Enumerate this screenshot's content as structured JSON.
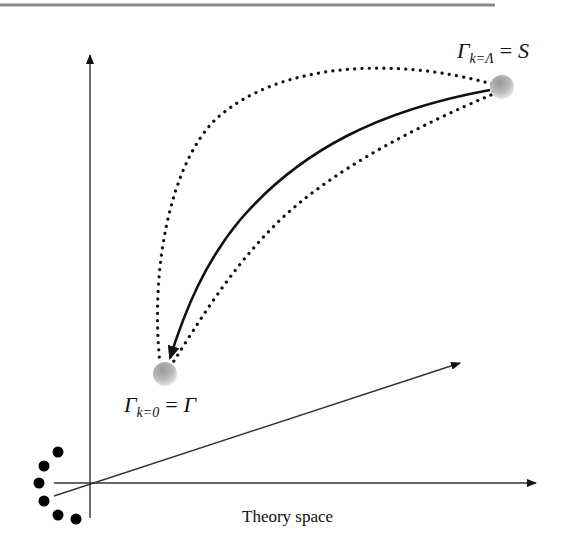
{
  "figure": {
    "type": "rg-flow-theory-space",
    "top_rule_color": "#8a8a8a",
    "line_color": "#111111"
  },
  "axes": {
    "horizontal_label": "Theory space",
    "count": 3
  },
  "points": {
    "start": {
      "symbol": "Γ",
      "subscript": "k=Λ",
      "relation": "=",
      "value": "S",
      "description": "bare action at UV cutoff"
    },
    "end": {
      "symbol": "Γ",
      "subscript": "k=0",
      "relation": "=",
      "value": "Γ",
      "description": "full effective action"
    }
  },
  "trajectories": [
    {
      "style": "solid",
      "arrow": true,
      "role": "flow"
    },
    {
      "style": "dotted",
      "arrow": false,
      "role": "alternative-upper"
    },
    {
      "style": "dotted",
      "arrow": false,
      "role": "alternative-lower"
    }
  ],
  "ellipsis_dots": 6
}
